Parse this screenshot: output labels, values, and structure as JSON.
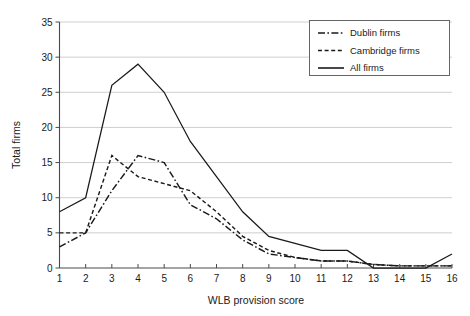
{
  "chart_data": {
    "type": "line",
    "title": "",
    "xlabel": "WLB provision score",
    "ylabel": "Total firms",
    "x": [
      1,
      2,
      3,
      4,
      5,
      6,
      7,
      8,
      9,
      10,
      11,
      12,
      13,
      14,
      15,
      16
    ],
    "xlim": [
      1,
      16
    ],
    "ylim": [
      0,
      35
    ],
    "ytick_step": 5,
    "yticks": [
      0,
      5,
      10,
      15,
      20,
      25,
      30,
      35
    ],
    "xticks": [
      1,
      2,
      3,
      4,
      5,
      6,
      7,
      8,
      9,
      10,
      11,
      12,
      13,
      14,
      15,
      16
    ],
    "grid": "horizontal",
    "legend_position": "top-right",
    "series": [
      {
        "name": "Dublin firms",
        "style": "dash-dot",
        "values": [
          3,
          5,
          11,
          16,
          15,
          9,
          7,
          4,
          2,
          1.5,
          1,
          1,
          0.5,
          0.3,
          0.3,
          0.3
        ]
      },
      {
        "name": "Cambridge firms",
        "style": "dashed",
        "values": [
          5,
          5,
          16,
          13,
          12,
          11,
          8,
          4.5,
          2.5,
          1.5,
          1,
          1,
          0.5,
          0.3,
          0.3,
          0.3
        ]
      },
      {
        "name": "All firms",
        "style": "solid",
        "values": [
          8,
          10,
          26,
          29,
          25,
          18,
          13,
          8,
          4.5,
          3.5,
          2.5,
          2.5,
          0,
          0,
          0,
          2
        ]
      }
    ]
  },
  "legend": {
    "entries": [
      {
        "label": "Dublin firms",
        "style": "dash-dot"
      },
      {
        "label": "Cambridge firms",
        "style": "dashed"
      },
      {
        "label": "All firms",
        "style": "solid"
      }
    ]
  },
  "axes": {
    "y_title": "Total firms",
    "x_title": "WLB provision score",
    "y_tick_labels": [
      "0",
      "5",
      "10",
      "15",
      "20",
      "25",
      "30",
      "35"
    ],
    "x_tick_labels": [
      "1",
      "2",
      "3",
      "4",
      "5",
      "6",
      "7",
      "8",
      "9",
      "10",
      "11",
      "12",
      "13",
      "14",
      "15",
      "16"
    ]
  },
  "colors": {
    "line": "#1a1a1a",
    "grid": "#c9c9c9",
    "axis": "#4a4a4a",
    "background": "#ffffff"
  }
}
